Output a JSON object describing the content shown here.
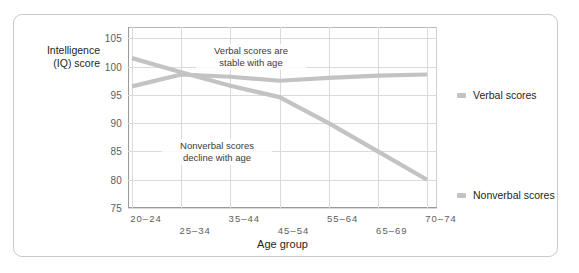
{
  "chart_data": {
    "type": "line",
    "title": "",
    "xlabel": "Age group",
    "ylabel": "Intelligence\n(IQ) score",
    "categories": [
      "20–24",
      "25–34",
      "35–44",
      "45–54",
      "55–64",
      "65–69",
      "70–74"
    ],
    "series": [
      {
        "name": "Verbal scores",
        "color": "#c3c3c3",
        "values": [
          96.5,
          98.6,
          98.2,
          97.5,
          98.0,
          98.4,
          98.6
        ]
      },
      {
        "name": "Nonverbal scores",
        "color": "#c3c3c3",
        "values": [
          101.5,
          99.0,
          96.6,
          94.6,
          90.0,
          85.0,
          80.0
        ]
      }
    ],
    "ylim": [
      75,
      107
    ],
    "yticks": [
      75,
      80,
      85,
      90,
      95,
      100,
      105
    ],
    "grid": true,
    "legend_position": "right",
    "annotations": [
      {
        "text": "Verbal scores are\nstable with age"
      },
      {
        "text": "Nonverbal scores\ndecline with age"
      }
    ]
  },
  "axis": {
    "y_title": "Intelligence\n(IQ) score",
    "x_title": "Age group",
    "y_tick_labels": [
      "105",
      "100",
      "95",
      "90",
      "85",
      "80",
      "75"
    ],
    "x_tick_labels": [
      "20–24",
      "25–34",
      "35–44",
      "45–54",
      "55–64",
      "65–69",
      "70–74"
    ]
  },
  "annotations": {
    "verbal": "Verbal scores are\nstable with age",
    "nonverbal": "Nonverbal scores\ndecline with age"
  },
  "legend": {
    "verbal_label": "Verbal scores",
    "nonverbal_label": "Nonverbal scores"
  },
  "colors": {
    "series_line": "#c3c3c3",
    "grid": "#dadada",
    "axis": "#9a9a9a",
    "frame": "#c9c9c9",
    "text": "#231f20",
    "tick_text": "#5d5d5d"
  }
}
